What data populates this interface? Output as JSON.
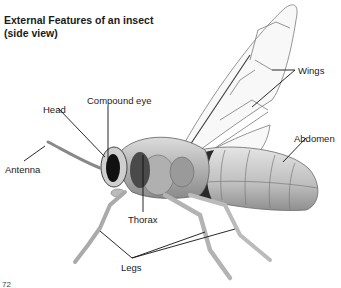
{
  "title": {
    "line1": "External Features of an insect",
    "line2": "(side view)"
  },
  "labels": {
    "head": "Head",
    "compound_eye": "Compound eye",
    "wings": "Wings",
    "abdomen": "Abdomen",
    "antenna": "Antenna",
    "thorax": "Thorax",
    "legs": "Legs"
  },
  "page_number": "72",
  "colors": {
    "body_light": "#d8d8d8",
    "body_mid": "#a9a9a9",
    "body_dark": "#3a3a3a",
    "wing_vein": "#777777",
    "leader_line": "#111111"
  }
}
